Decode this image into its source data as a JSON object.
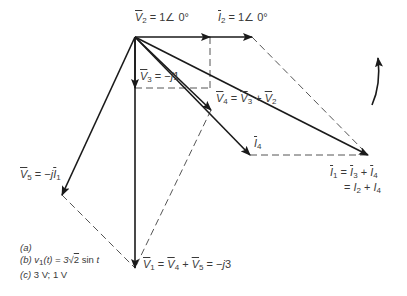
{
  "figure": {
    "type": "phasor-diagram",
    "rotation_indicator": "counterclockwise-arrow",
    "origin": [
      135,
      37
    ],
    "phasors": [
      {
        "id": "V2",
        "label": "V̄2 = 1∠0°",
        "end": [
          210,
          37
        ],
        "style": "solid"
      },
      {
        "id": "I2",
        "label": "Ī2 = 1∠0°",
        "start": [
          210,
          37
        ],
        "end": [
          252,
          37
        ],
        "style": "solid"
      },
      {
        "id": "V3",
        "label": "V̄3 = −j1",
        "end": [
          135,
          88
        ],
        "style": "solid"
      },
      {
        "id": "V4",
        "label": "V̄4 = V̄3 + V̄2",
        "end": [
          211,
          110
        ],
        "style": "solid"
      },
      {
        "id": "I4",
        "label": "Ī4",
        "end": [
          250,
          155
        ],
        "style": "solid"
      },
      {
        "id": "I1",
        "label": "Ī1 = Ī3 + Ī4 = I2 + I4",
        "end": [
          368,
          155
        ],
        "style": "solid"
      },
      {
        "id": "V5",
        "label": "V̄5 = −jĪ1",
        "end": [
          62,
          195
        ],
        "style": "solid"
      },
      {
        "id": "V1",
        "label": "V̄1 = V̄4 + V̄5 = −j3",
        "end": [
          135,
          268
        ],
        "style": "solid"
      }
    ],
    "construction_lines": [
      {
        "from": [
          210,
          37
        ],
        "to": [
          210,
          88
        ]
      },
      {
        "from": [
          135,
          88
        ],
        "to": [
          210,
          88
        ]
      },
      {
        "from": [
          252,
          37
        ],
        "to": [
          368,
          155
        ]
      },
      {
        "from": [
          250,
          155
        ],
        "to": [
          368,
          155
        ]
      },
      {
        "from": [
          211,
          110
        ],
        "to": [
          135,
          268
        ]
      },
      {
        "from": [
          62,
          195
        ],
        "to": [
          135,
          268
        ]
      }
    ]
  },
  "labels": {
    "v2": {
      "sym": "V",
      "sub": "2",
      "rest": " = 1∠ 0°"
    },
    "i2": {
      "sym": "I",
      "sub": "2",
      "rest": " =  1∠ 0°"
    },
    "v3": {
      "sym": "V",
      "sub": "3",
      "rest": " = −",
      "j": "j",
      "tail": "1"
    },
    "v4": {
      "sym": "V",
      "sub": "4",
      "eq": " = ",
      "a_sym": "V",
      "a_sub": "3",
      "plus": " + ",
      "b_sym": "V",
      "b_sub": "2"
    },
    "i4": {
      "sym": "I",
      "sub": "4"
    },
    "i1_line1": {
      "sym": "I",
      "sub": "1",
      "eq": " = ",
      "a_sym": "I",
      "a_sub": "3",
      "plus": " + ",
      "b_sym": "I",
      "b_sub": "4"
    },
    "i1_line2": {
      "eq": "= ",
      "a_sym": "I",
      "a_sub": "2",
      "plus": " + ",
      "b_sym": "I",
      "b_sub": "4"
    },
    "v5": {
      "sym": "V",
      "sub": "5",
      "rest": " = −",
      "j": "j",
      "i_sym": "I",
      "i_sub": "1"
    },
    "v1": {
      "sym": "V",
      "sub": "1",
      "eq": " = ",
      "a_sym": "V",
      "a_sub": "4",
      "plus": " + ",
      "b_sym": "V",
      "b_sub": "5",
      "tail": " = −",
      "j": "j",
      "num": "3"
    }
  },
  "caption": {
    "a": "(a)",
    "b_prefix": "(b)",
    "b_expr_lhs": "v",
    "b_expr_sub": "1",
    "b_expr_arg": "(t) = 3",
    "b_sqrt": "2",
    "b_tail": " sin ",
    "b_t": "t",
    "c_prefix": "(c)",
    "c_text": " 3 V; 1 V"
  },
  "colors": {
    "line": "#1a1a1a",
    "dashed": "#555555",
    "text": "#3a3a3a",
    "background": "#ffffff"
  }
}
